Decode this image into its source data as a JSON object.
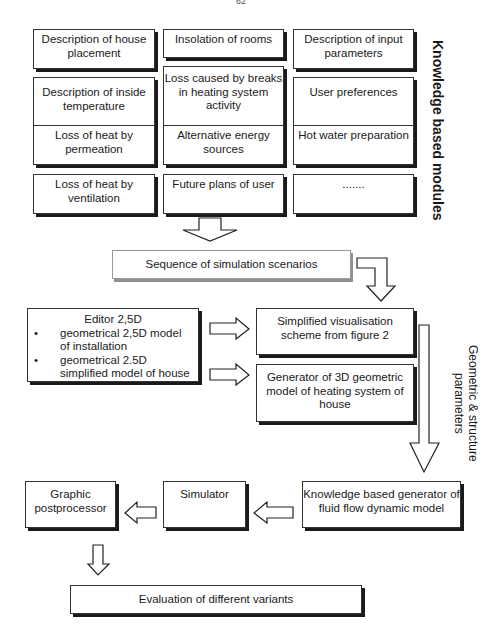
{
  "page": {
    "page_number": "62"
  },
  "knowledge_modules": {
    "label": "Knowledge based modules",
    "grid": [
      [
        "Description of house placement",
        "Insolation of rooms",
        "Description of input parameters"
      ],
      [
        "Description of inside temperature",
        "Loss caused by breaks in heating system activity",
        "User preferences"
      ],
      [
        "Loss of heat by permeation",
        "Alternative energy sources",
        "Hot water preparation"
      ],
      [
        "Loss of heat by ventilation",
        "Future plans of user",
        "......."
      ]
    ]
  },
  "sequence": {
    "label": "Sequence of simulation scenarios"
  },
  "editor": {
    "title": "Editor 2,5D",
    "bullets": [
      "geometrical 2,5D model of installation",
      "geometrical 2.5D simplified model of house"
    ]
  },
  "visualisation": {
    "label": "Simplified visualisation scheme from figure 2"
  },
  "generator3d": {
    "label": "Generator of 3D geometric model of heating system of house"
  },
  "side_label": {
    "line1": "Geometric & structure",
    "line2": "parameters"
  },
  "fluid_generator": {
    "label": "Knowledge based generator of fluid flow dynamic model"
  },
  "simulator": {
    "label": "Simulator"
  },
  "postprocessor": {
    "label": "Graphic postprocessor"
  },
  "evaluation": {
    "label": "Evaluation of different variants"
  }
}
